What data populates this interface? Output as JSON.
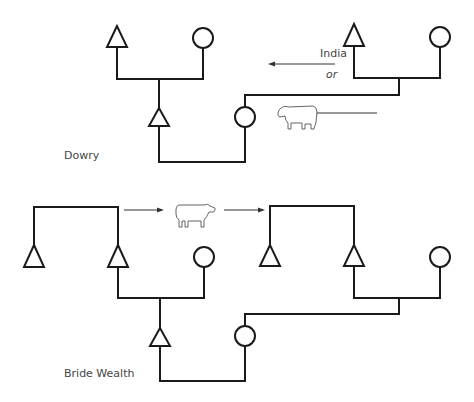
{
  "diagram": {
    "type": "kinship-diagram",
    "sections": [
      {
        "id": "dowry",
        "label": "Dowry",
        "annotation": {
          "line1": "India",
          "line2": "or"
        },
        "transfer_item": "cow-icon",
        "transfer_direction": "from bride's family to groom's family (right to left)"
      },
      {
        "id": "bride-wealth",
        "label": "Bride Wealth",
        "transfer_item": "cow-icon",
        "transfer_direction": "from groom's family to bride's family (left to right)"
      }
    ],
    "legend": {
      "triangle": "male",
      "circle": "female"
    },
    "colors": {
      "line": "#1a1a1a",
      "text": "#444444",
      "background": "#ffffff"
    }
  }
}
